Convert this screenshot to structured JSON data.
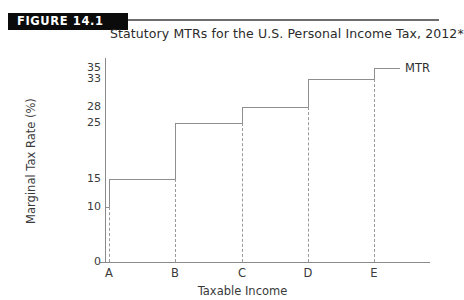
{
  "header": {
    "figure_tag": "FIGURE 14.1",
    "title": "Statutory MTRs for the U.S. Personal Income Tax, 2012*"
  },
  "axes": {
    "y_title": "Marginal Tax Rate (%)",
    "x_title": "Taxable Income"
  },
  "series_label": "MTR",
  "colors": {
    "tag_background": "#0b0b0b",
    "tag_text": "#ffffff",
    "line": "#8e8e8e",
    "axis": "#8a8a8a",
    "text": "#2b2b2b",
    "dash": "#9a9a9a"
  },
  "chart_data": {
    "type": "line",
    "title": "Statutory MTRs for the U.S. Personal Income Tax, 2012*",
    "xlabel": "Taxable Income",
    "ylabel": "Marginal Tax Rate (%)",
    "grid": false,
    "legend": "MTR",
    "legend_position": "right-of-last-step",
    "ylim": [
      0,
      35
    ],
    "yticks": [
      0,
      10,
      15,
      25,
      28,
      33,
      35
    ],
    "ytick_labels": [
      "0",
      "10",
      "15",
      "25",
      "28",
      "33",
      "35"
    ],
    "xticks": [
      "A",
      "B",
      "C",
      "D",
      "E"
    ],
    "xtick_labels": [
      "A",
      "B",
      "C",
      "D",
      "E"
    ],
    "step_style": "post",
    "steps": [
      {
        "from": "origin",
        "to": "A",
        "value": 10
      },
      {
        "from": "A",
        "to": "B",
        "value": 15
      },
      {
        "from": "B",
        "to": "C",
        "value": 25
      },
      {
        "from": "C",
        "to": "D",
        "value": 28
      },
      {
        "from": "D",
        "to": "E",
        "value": 33
      },
      {
        "from": "E",
        "to": "end",
        "value": 35
      }
    ],
    "values": [
      10,
      15,
      25,
      28,
      33,
      35
    ],
    "categories": [
      "origin-A",
      "A-B",
      "B-C",
      "C-D",
      "D-E",
      "E+"
    ]
  }
}
